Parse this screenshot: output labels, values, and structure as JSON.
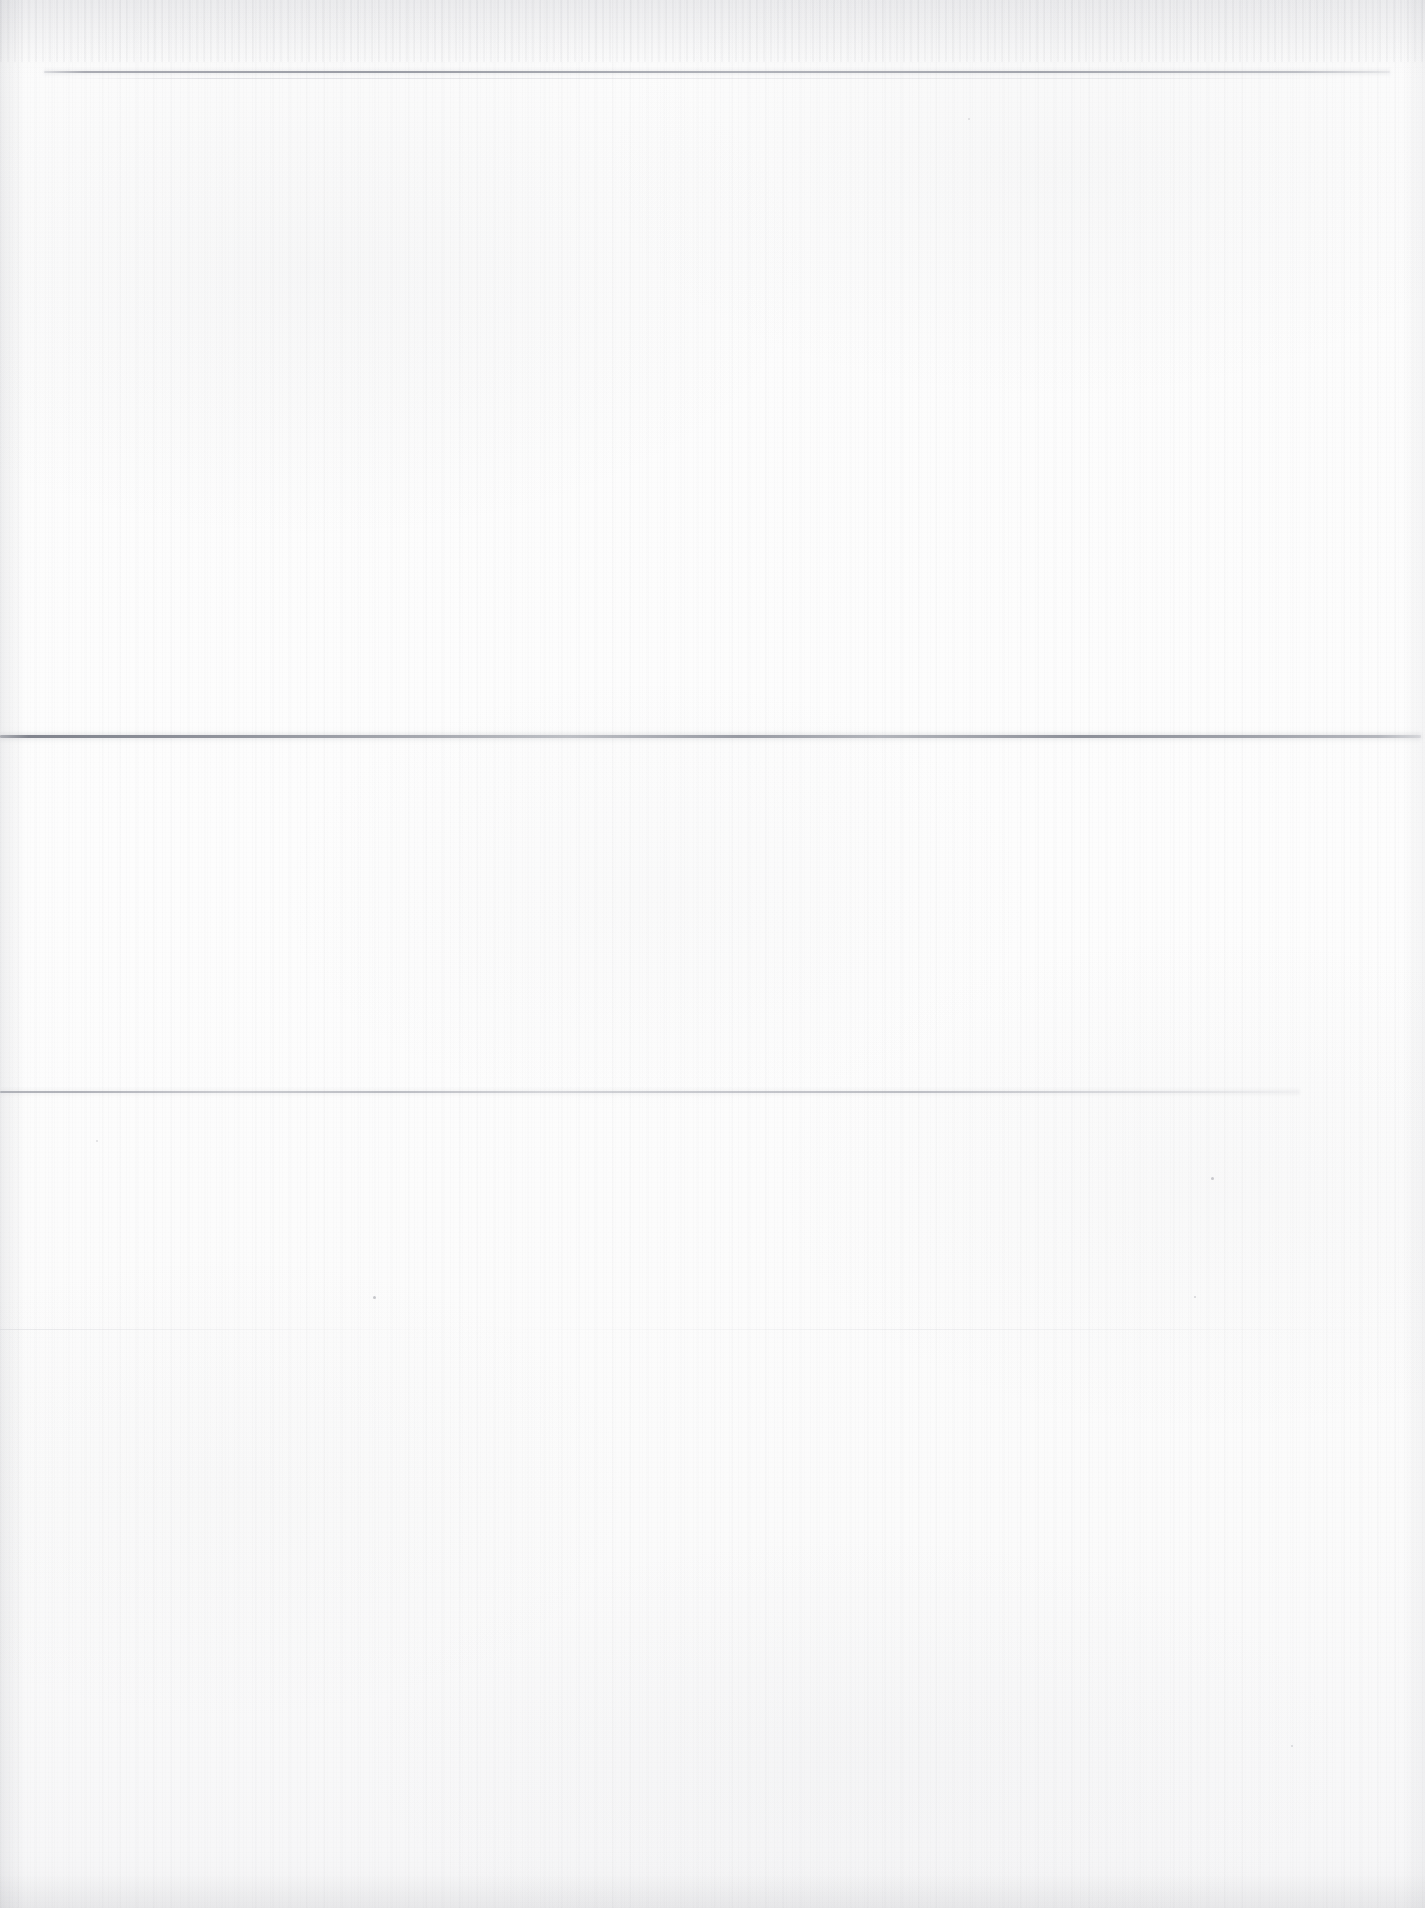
{
  "document": {
    "kind": "scanned-page",
    "title": "Scanned blank page",
    "page_width": 1425,
    "page_height": 1908,
    "visible_text": "",
    "text_content_present": false,
    "paper_color": "#fbfbfb",
    "paper_tint": "#f6f6f7",
    "ink_color": "#8a8d96"
  },
  "rules": [
    {
      "id": "rule-1",
      "label": "top horizontal rule",
      "y": 71,
      "x_start": 44,
      "x_end": 1390,
      "thickness_px": 2,
      "color": "#8e9199",
      "opacity": "faint"
    },
    {
      "id": "rule-1b",
      "label": "secondary hairline under top rule",
      "y": 78,
      "x_start": 60,
      "x_end": 1340,
      "thickness_px": 1,
      "color": "#b6b8c0",
      "opacity": "very-faint"
    },
    {
      "id": "rule-2",
      "label": "middle horizontal rule",
      "y": 735,
      "x_start": 0,
      "x_end": 1421,
      "thickness_px": 3,
      "color": "#7c7f89",
      "opacity": "strongest"
    },
    {
      "id": "rule-3",
      "label": "lower horizontal rule",
      "y": 1091,
      "x_start": 0,
      "x_end": 1300,
      "thickness_px": 2,
      "color": "#989ba4",
      "opacity": "faint"
    },
    {
      "id": "rule-4",
      "label": "trace horizontal rule",
      "y": 1329,
      "x_start": 0,
      "x_end": 1395,
      "thickness_px": 1,
      "color": "#c4c6cc",
      "opacity": "barely-visible"
    }
  ],
  "bands": [
    {
      "id": "band-header",
      "label": "header margin band",
      "top": 0,
      "height": 71,
      "text": ""
    },
    {
      "id": "band-upper",
      "label": "upper content band",
      "top": 73,
      "height": 662,
      "text": ""
    },
    {
      "id": "band-middle",
      "label": "middle content band",
      "top": 738,
      "height": 353,
      "text": ""
    },
    {
      "id": "band-lower",
      "label": "lower content band",
      "top": 1093,
      "height": 815,
      "text": ""
    }
  ],
  "edges": {
    "top_shade": {
      "label": "top edge shadow",
      "height": 62
    },
    "left_shade": {
      "label": "left edge shadow",
      "width": 26
    },
    "right_shade": {
      "label": "right edge shadow",
      "width": 22
    },
    "bottom_shade": {
      "label": "bottom edge shadow",
      "height": 34
    }
  },
  "specks": [
    {
      "x": 373,
      "y": 1296,
      "size": 3,
      "color": "rgba(120,122,132,0.40)"
    },
    {
      "x": 1211,
      "y": 1177,
      "size": 3,
      "color": "rgba(120,122,132,0.38)"
    },
    {
      "x": 1194,
      "y": 1296,
      "size": 2,
      "color": "rgba(130,132,142,0.32)"
    },
    {
      "x": 1291,
      "y": 1745,
      "size": 2,
      "color": "rgba(130,132,142,0.30)"
    },
    {
      "x": 96,
      "y": 1140,
      "size": 2,
      "color": "rgba(130,132,142,0.26)"
    },
    {
      "x": 968,
      "y": 118,
      "size": 2,
      "color": "rgba(135,137,147,0.26)"
    }
  ]
}
